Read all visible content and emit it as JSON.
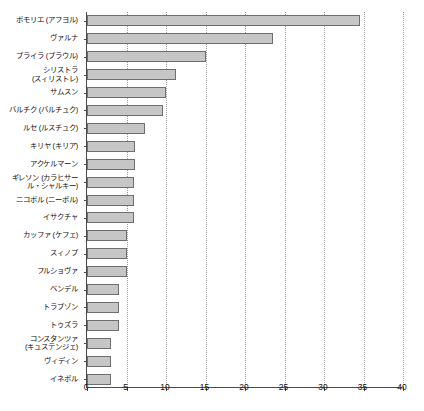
{
  "chart_data": {
    "type": "bar",
    "orientation": "horizontal",
    "title": "",
    "subtitle": "",
    "xlabel": "",
    "ylabel": "",
    "xlim": [
      0,
      40
    ],
    "xticks": [
      0,
      5,
      10,
      15,
      20,
      25,
      30,
      35,
      40
    ],
    "grid": "vertical-dotted",
    "legend": "none",
    "bar_fill_color": "#c6c6c6",
    "bar_border_color": "#6e6e6e",
    "axis_color": "#4a4a4a",
    "gridline_color": "#9a9a9a",
    "categories": [
      "ポモリエ (アフヨル)",
      "ヴァルナ",
      "ブライラ (ブラウル)",
      "シリストラ\n(スィリストレ)",
      "サムスン",
      "バルチク (バルチュク)",
      "ルセ (ルスチュク)",
      "キリヤ (キリア)",
      "アクケルマーン",
      "ギレソン (カラヒサー\nル・シャルキー)",
      "ニコポル (ニーボル)",
      "イサクチャ",
      "カッファ (ケフェ)",
      "スィノプ",
      "フルショヴァ",
      "ベンデル",
      "トラブゾン",
      "トゥズラ",
      "コンスタンツァ\n(キュステンジェ)",
      "ヴィディン",
      "イネボル"
    ],
    "values": [
      34.5,
      23.5,
      15.0,
      11.3,
      10.0,
      9.6,
      7.4,
      6.1,
      6.1,
      6.0,
      6.0,
      6.0,
      5.1,
      5.0,
      5.0,
      4.1,
      4.0,
      4.0,
      3.1,
      3.0,
      3.0
    ]
  }
}
